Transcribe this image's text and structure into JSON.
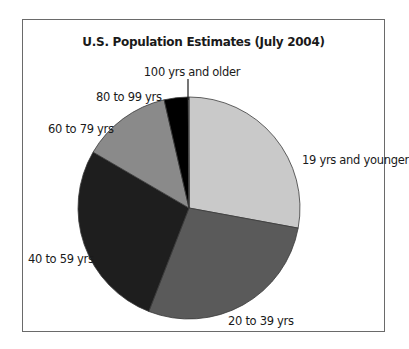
{
  "chart_data": {
    "type": "pie",
    "title": "U.S. Population Estimates (July 2004)",
    "categories": [
      "19 yrs and younger",
      "20 to 39 yrs",
      "40 to 59 yrs",
      "60 to 79 yrs",
      "80 to 99 yrs",
      "100 yrs and older"
    ],
    "values": [
      27.9,
      28.0,
      27.5,
      13.0,
      3.5,
      0.1
    ],
    "unit": "percent of population (approx.)",
    "colors": [
      "#c9c9c9",
      "#5a5a5a",
      "#1e1e1e",
      "#8a8a8a",
      "#000000",
      "#b0b0b0"
    ],
    "start_angle": "12 o'clock, clockwise",
    "legend": "none (direct labels)",
    "grid": false
  },
  "labels": {
    "title": "U.S. Population Estimates (July 2004)",
    "s0": "19 yrs and younger",
    "s1": "20 to 39 yrs",
    "s2": "40 to 59 yrs",
    "s3": "60 to 79 yrs",
    "s4": "80 to 99 yrs",
    "s5": "100 yrs and older"
  }
}
